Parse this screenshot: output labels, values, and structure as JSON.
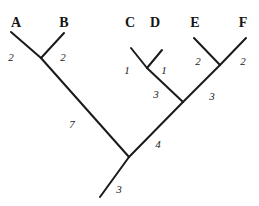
{
  "figure": {
    "type": "phylogenetic-tree",
    "background_color": "#ffffff",
    "stroke_color": "#1a1a1a",
    "stroke_width": 2,
    "width": 259,
    "height": 206
  },
  "taxa": [
    {
      "id": "A",
      "label": "A",
      "x": 16,
      "y": 16
    },
    {
      "id": "B",
      "label": "B",
      "x": 64,
      "y": 16
    },
    {
      "id": "C",
      "label": "C",
      "x": 130,
      "y": 16
    },
    {
      "id": "D",
      "label": "D",
      "x": 155,
      "y": 16
    },
    {
      "id": "E",
      "label": "E",
      "x": 195,
      "y": 16
    },
    {
      "id": "F",
      "label": "F",
      "x": 243,
      "y": 16
    }
  ],
  "branches": [
    {
      "id": "branch-A",
      "from_x": 41,
      "from_y": 58,
      "to_x": 11,
      "to_y": 32
    },
    {
      "id": "branch-B",
      "from_x": 41,
      "from_y": 58,
      "to_x": 64,
      "to_y": 33
    },
    {
      "id": "branch-AB",
      "from_x": 129,
      "from_y": 157,
      "to_x": 41,
      "to_y": 58
    },
    {
      "id": "branch-C",
      "from_x": 147,
      "from_y": 68,
      "to_x": 131,
      "to_y": 48
    },
    {
      "id": "branch-D",
      "from_x": 147,
      "from_y": 68,
      "to_x": 162,
      "to_y": 50
    },
    {
      "id": "branch-CD",
      "from_x": 183,
      "from_y": 102,
      "to_x": 147,
      "to_y": 68
    },
    {
      "id": "branch-E",
      "from_x": 220,
      "from_y": 65,
      "to_x": 194,
      "to_y": 38
    },
    {
      "id": "branch-F",
      "from_x": 220,
      "from_y": 65,
      "to_x": 246,
      "to_y": 38
    },
    {
      "id": "branch-EF",
      "from_x": 183,
      "from_y": 102,
      "to_x": 220,
      "to_y": 65
    },
    {
      "id": "branch-CDEF",
      "from_x": 129,
      "from_y": 157,
      "to_x": 183,
      "to_y": 102
    },
    {
      "id": "branch-root",
      "from_x": 129,
      "from_y": 157,
      "to_x": 100,
      "to_y": 197
    }
  ],
  "branch_lengths": [
    {
      "id": "len-A",
      "branch": "branch-A",
      "value": "2",
      "x": 11,
      "y": 52
    },
    {
      "id": "len-B",
      "branch": "branch-B",
      "value": "2",
      "x": 63,
      "y": 52
    },
    {
      "id": "len-AB",
      "branch": "branch-AB",
      "value": "7",
      "x": 72,
      "y": 119
    },
    {
      "id": "len-C",
      "branch": "branch-C",
      "value": "1",
      "x": 127,
      "y": 65
    },
    {
      "id": "len-D",
      "branch": "branch-D",
      "value": "1",
      "x": 164,
      "y": 65
    },
    {
      "id": "len-CD",
      "branch": "branch-CD",
      "value": "3",
      "x": 156,
      "y": 89
    },
    {
      "id": "len-E",
      "branch": "branch-E",
      "value": "2",
      "x": 198,
      "y": 56
    },
    {
      "id": "len-F",
      "branch": "branch-F",
      "value": "2",
      "x": 243,
      "y": 56
    },
    {
      "id": "len-EF",
      "branch": "branch-EF",
      "value": "3",
      "x": 212,
      "y": 91
    },
    {
      "id": "len-CDEF",
      "branch": "branch-CDEF",
      "value": "4",
      "x": 158,
      "y": 139
    },
    {
      "id": "len-root",
      "branch": "branch-root",
      "value": "3",
      "x": 119,
      "y": 184
    }
  ],
  "chart_data": {
    "type": "diagram",
    "subtype": "phylogenetic-tree",
    "title": "",
    "taxa": [
      "A",
      "B",
      "C",
      "D",
      "E",
      "F"
    ],
    "topology": "(((A:2,B:2):7,((C:1,D:1):3,(E:2,F:2):3):4):3)",
    "edges": [
      {
        "name": "A",
        "parent": "AB",
        "length": 2
      },
      {
        "name": "B",
        "parent": "AB",
        "length": 2
      },
      {
        "name": "AB",
        "parent": "root",
        "length": 7
      },
      {
        "name": "C",
        "parent": "CD",
        "length": 1
      },
      {
        "name": "D",
        "parent": "CD",
        "length": 1
      },
      {
        "name": "CD",
        "parent": "CDEF",
        "length": 3
      },
      {
        "name": "E",
        "parent": "EF",
        "length": 2
      },
      {
        "name": "F",
        "parent": "EF",
        "length": 2
      },
      {
        "name": "EF",
        "parent": "CDEF",
        "length": 3
      },
      {
        "name": "CDEF",
        "parent": "root",
        "length": 4
      },
      {
        "name": "root",
        "parent": null,
        "length": 3
      }
    ],
    "leaf_count": 6,
    "internal_node_count": 5
  }
}
